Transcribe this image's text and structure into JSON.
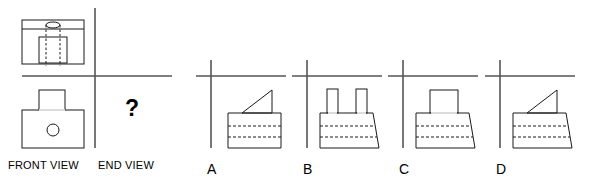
{
  "page": {
    "kind": "orthographic-projection-puzzle",
    "width": 595,
    "height": 186,
    "background": "#ffffff",
    "line_color": "#1a1a1a",
    "axis_color": "#555555",
    "dashed_color": "#1a1a1a"
  },
  "given": {
    "plan_view": {
      "name": "plan-view",
      "outer_rect": {
        "x": 22,
        "y": 20,
        "w": 62,
        "h": 44
      },
      "top_divider_y": 29,
      "ellipse": {
        "cx": 53,
        "cy": 25,
        "rx": 7,
        "ry": 3
      },
      "inner_rect": {
        "x": 39,
        "y": 37,
        "w": 28,
        "h": 26
      },
      "dashed_verticals": [
        {
          "x": 46,
          "y1": 25,
          "y2": 66
        },
        {
          "x": 60,
          "y1": 25,
          "y2": 66
        }
      ]
    },
    "front_view": {
      "name": "front-view",
      "label": "FRONT VIEW",
      "base_rect": {
        "x": 22,
        "y": 110,
        "w": 62,
        "h": 38
      },
      "boss_rect": {
        "x": 39,
        "y": 90,
        "w": 26,
        "h": 20
      },
      "circle": {
        "cx": 53,
        "cy": 130,
        "r": 6
      }
    },
    "end_view": {
      "name": "end-view",
      "label": "END VIEW",
      "question_mark": "?",
      "question_pos": {
        "x": 125,
        "y": 97
      }
    },
    "axes": {
      "vertical": {
        "x": 95,
        "y1": 8,
        "y2": 148
      },
      "horizontal": {
        "x1": 22,
        "y1": 76,
        "x2": 172
      }
    }
  },
  "labels": {
    "front_view": "FRONT VIEW",
    "end_view": "END VIEW"
  },
  "options": [
    {
      "letter": "A",
      "name": "option-a",
      "label_pos": {
        "x": 207,
        "y": 162
      },
      "axes": {
        "vx": 211,
        "vy1": 60,
        "vy2": 148,
        "hx1": 196,
        "hx2": 286,
        "hy": 76
      },
      "body": {
        "shape": "rectangle",
        "points": "228,113 281,113 281,148 228,148",
        "dashes": [
          {
            "x1": 228,
            "y1": 126,
            "x2": 281,
            "y2": 126
          },
          {
            "x1": 228,
            "y1": 137,
            "x2": 281,
            "y2": 137
          }
        ]
      },
      "top_feature": {
        "shape": "right-triangle",
        "points": "242,113 272,90 272,113"
      }
    },
    {
      "letter": "B",
      "name": "option-b",
      "label_pos": {
        "x": 303,
        "y": 162
      },
      "axes": {
        "vx": 307,
        "vy1": 60,
        "vy2": 148,
        "hx1": 292,
        "hx2": 382,
        "hy": 76
      },
      "body": {
        "shape": "trapezoid",
        "points": "320,113 373,113 379,148 320,148",
        "dashes": [
          {
            "x1": 320,
            "y1": 126,
            "x2": 375,
            "y2": 126
          },
          {
            "x1": 320,
            "y1": 137,
            "x2": 377,
            "y2": 137
          }
        ]
      },
      "top_feature": {
        "shape": "two-prongs",
        "prongs": [
          {
            "x": 327,
            "y": 89,
            "w": 11,
            "h": 24
          },
          {
            "x": 356,
            "y": 89,
            "w": 11,
            "h": 24
          }
        ]
      }
    },
    {
      "letter": "C",
      "name": "option-c",
      "label_pos": {
        "x": 399,
        "y": 162
      },
      "axes": {
        "vx": 403,
        "vy1": 60,
        "vy2": 148,
        "hx1": 388,
        "hx2": 478,
        "hy": 76
      },
      "body": {
        "shape": "trapezoid",
        "points": "416,113 469,113 475,148 416,148",
        "dashes": [
          {
            "x1": 416,
            "y1": 126,
            "x2": 471,
            "y2": 126
          },
          {
            "x1": 416,
            "y1": 137,
            "x2": 473,
            "y2": 137
          }
        ]
      },
      "top_feature": {
        "shape": "rectangle",
        "rect": {
          "x": 430,
          "y": 90,
          "w": 28,
          "h": 23
        }
      }
    },
    {
      "letter": "D",
      "name": "option-d",
      "label_pos": {
        "x": 496,
        "y": 162
      },
      "axes": {
        "vx": 500,
        "vy1": 60,
        "vy2": 148,
        "hx1": 485,
        "hx2": 575,
        "hy": 76
      },
      "body": {
        "shape": "trapezoid",
        "points": "513,113 566,113 572,148 513,148",
        "dashes": [
          {
            "x1": 513,
            "y1": 126,
            "x2": 568,
            "y2": 126
          },
          {
            "x1": 513,
            "y1": 137,
            "x2": 570,
            "y2": 137
          }
        ]
      },
      "top_feature": {
        "shape": "right-triangle",
        "points": "527,113 557,90 557,113"
      }
    }
  ]
}
